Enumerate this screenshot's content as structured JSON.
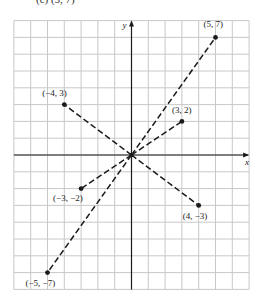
{
  "header": {
    "text": "(c)  (5, 7)"
  },
  "chart_data": {
    "type": "scatter",
    "title": "",
    "xlabel": "x",
    "ylabel": "y",
    "xlim": [
      -7,
      7
    ],
    "ylim": [
      -8,
      8
    ],
    "grid": true,
    "points": [
      {
        "x": 5,
        "y": 7,
        "label": "(5, 7)"
      },
      {
        "x": -4,
        "y": 3,
        "label": "(−4, 3)"
      },
      {
        "x": 3,
        "y": 2,
        "label": "(3, 2)"
      },
      {
        "x": -3,
        "y": -2,
        "label": "(−3, −2)"
      },
      {
        "x": 4,
        "y": -3,
        "label": "(4, −3)"
      },
      {
        "x": -5,
        "y": -7,
        "label": "(−5, −7)"
      }
    ],
    "segments_from_origin": true,
    "line_style": "dashed"
  },
  "colors": {
    "grid": "#c8c8c8",
    "ink": "#1a1a1a"
  }
}
